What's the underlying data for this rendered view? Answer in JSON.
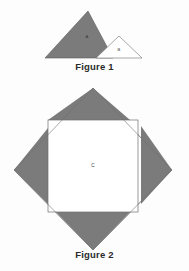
{
  "page": {
    "background_color": "#fdfdfd",
    "width": 189,
    "height": 271
  },
  "figure1": {
    "caption": "Figure 1",
    "large_triangle": {
      "label": "A",
      "fill_color": "#7b7b7b",
      "stroke_color": "#5a5a5a",
      "points": "45,58 88,11 113,58",
      "label_x": 87,
      "label_y": 37
    },
    "small_triangle": {
      "label": "B",
      "fill_color": "#ffffff",
      "stroke_color": "#6e6e6e",
      "points": "96,58 119,36 142,58",
      "label_x": 119,
      "label_y": 50
    }
  },
  "figure2": {
    "caption": "Figure 2",
    "diamond": {
      "fill_color": "#ffffff",
      "stroke_color": "#6e6e6e",
      "points": "93,6 172,88 93,168 14,88"
    },
    "inner_square": {
      "label": "C",
      "fill_color": "#ffffff",
      "stroke_color": "#6e6e6e",
      "x": 48,
      "y": 38,
      "width": 90,
      "height": 92,
      "label_x": 93,
      "label_y": 84
    },
    "corner_triangles": [
      {
        "name": "top-left-triangle",
        "fill_color": "#7b7b7b",
        "stroke_color": "#6e6e6e",
        "points": "48,38 93,6 138,38"
      },
      {
        "name": "top-right-triangle",
        "fill_color": "#7b7b7b",
        "stroke_color": "#6e6e6e",
        "points": "138,38 172,88 138,130"
      },
      {
        "name": "bottom-right-triangle",
        "fill_color": "#7b7b7b",
        "stroke_color": "#6e6e6e",
        "points": "138,130 93,168 48,130"
      },
      {
        "name": "bottom-left-triangle",
        "fill_color": "#7b7b7b",
        "stroke_color": "#6e6e6e",
        "points": "48,130 14,88 48,38"
      }
    ],
    "gray_wedges": [
      {
        "name": "wedge-top",
        "fill_color": "#7b7b7b",
        "points": "48,38 93,6 130,38"
      },
      {
        "name": "wedge-right",
        "fill_color": "#7b7b7b",
        "points": "141,44 172,88 141,122"
      },
      {
        "name": "wedge-bottom",
        "fill_color": "#7b7b7b",
        "points": "56,130 93,168 130,130"
      },
      {
        "name": "wedge-left",
        "fill_color": "#7b7b7b",
        "points": "48,46 48,122 14,88"
      }
    ]
  }
}
